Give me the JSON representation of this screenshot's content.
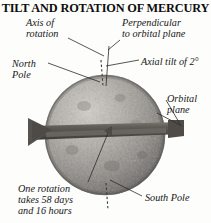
{
  "figure": {
    "title": "TILT AND ROTATION OF MERCURY",
    "subject": "Mercury",
    "background_color": "#fdfdfb",
    "text_color": "#17171a"
  },
  "labels": {
    "axis_of_rotation": "Axis of\nrotation",
    "axis_of_rotation_line1": "Axis of",
    "axis_of_rotation_line2": "rotation",
    "perpendicular_line1": "Perpendicular",
    "perpendicular_line2": "to orbital plane",
    "axial_tilt": "Axial tilt of 2°",
    "north_pole_line1": "North",
    "north_pole_line2": "Pole",
    "orbital_plane_line1": "Orbital",
    "orbital_plane_line2": "plane",
    "rotation_period_line1": "One rotation",
    "rotation_period_line2": "takes 58 days",
    "rotation_period_line3": "and 16 hours",
    "south_pole": "South Pole"
  },
  "values": {
    "axial_tilt_degrees": 2,
    "rotation_days": 58,
    "rotation_hours": 16
  },
  "colors": {
    "planet_base": "#9d9a95",
    "planet_light": "#c9c6c0",
    "planet_shadow": "#6b6864",
    "ring_band": "#55534f",
    "ring_band_light": "#6e6c67",
    "leader_line": "#2b2b2b",
    "title": "#0d0d0d"
  },
  "graphics": {
    "planet_name": "mercury-sphere",
    "ring_name": "orbital-plane-band",
    "axis_name": "rotation-axis-dashed-line",
    "rotation_arrow": "rotation-direction-arrow"
  }
}
